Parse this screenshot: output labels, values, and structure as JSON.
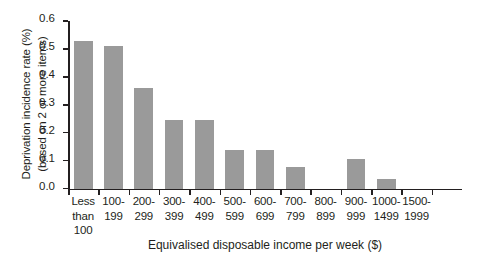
{
  "chart_data": {
    "type": "bar",
    "title": "",
    "xlabel": "Equivalised disposable income per week ($)",
    "ylabel": "Deprivation incidence rate (%)",
    "ylabel_line2": "(based on 2 or more items)",
    "categories": [
      "Less\nthan\n100",
      "100-\n199",
      "200-\n299",
      "300-\n399",
      "400-\n499",
      "500-\n599",
      "600-\n699",
      "700-\n799",
      "800-\n899",
      "900-\n999",
      "1000-\n1499",
      "1500-\n1999"
    ],
    "values": [
      0.53,
      0.51,
      0.36,
      0.247,
      0.247,
      0.138,
      0.138,
      0.076,
      0.0,
      0.104,
      0.033,
      0.0
    ],
    "ylim": [
      0.0,
      0.6
    ],
    "ytick_labels": [
      "0.0",
      "0.1",
      "0.2",
      "0.3",
      "0.4",
      "0.5",
      "0.6"
    ],
    "ytick_values": [
      0.0,
      0.1,
      0.2,
      0.3,
      0.4,
      0.5,
      0.6
    ],
    "grid": false,
    "legend": "none",
    "bar_color": "#9a9a9a",
    "axis_color": "#231f20"
  }
}
